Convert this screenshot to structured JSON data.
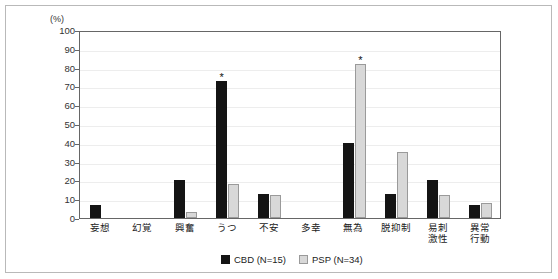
{
  "chart_data": {
    "type": "bar",
    "title": "",
    "subtitle": "",
    "xlabel": "",
    "ylabel": "(%)",
    "ylim": [
      0,
      100
    ],
    "ytick_step": 10,
    "yticks": [
      100,
      90,
      80,
      70,
      60,
      50,
      40,
      30,
      20,
      10,
      0
    ],
    "grid": true,
    "legend_position": "bottom-center",
    "categories": [
      "妄想",
      "幻覚",
      "興奮",
      "うつ",
      "不安",
      "多幸",
      "無為",
      "脱抑制",
      "易刺激性",
      "異常行動"
    ],
    "category_lines": [
      [
        "妄想"
      ],
      [
        "幻覚"
      ],
      [
        "興奮"
      ],
      [
        "うつ"
      ],
      [
        "不安"
      ],
      [
        "多幸"
      ],
      [
        "無為"
      ],
      [
        "脱抑制"
      ],
      [
        "易刺",
        "激性"
      ],
      [
        "異常",
        "行動"
      ]
    ],
    "series": [
      {
        "name": "CBD (N=15)",
        "key": "cbd",
        "color": "#141414",
        "values": [
          7,
          0,
          20,
          73,
          13,
          0,
          40,
          13,
          20,
          7
        ]
      },
      {
        "name": "PSP (N=34)",
        "key": "psp",
        "color": "#d8d8d8",
        "values": [
          0,
          0,
          3,
          18,
          12,
          0,
          82,
          35,
          12,
          8
        ]
      }
    ],
    "annotations": [
      {
        "symbol": "*",
        "category": "うつ",
        "series": "cbd"
      },
      {
        "symbol": "*",
        "category": "無為",
        "series": "psp"
      }
    ]
  },
  "legend": {
    "items": [
      {
        "label": "CBD (N=15)",
        "key": "cbd"
      },
      {
        "label": "PSP (N=34)",
        "key": "psp"
      }
    ]
  }
}
